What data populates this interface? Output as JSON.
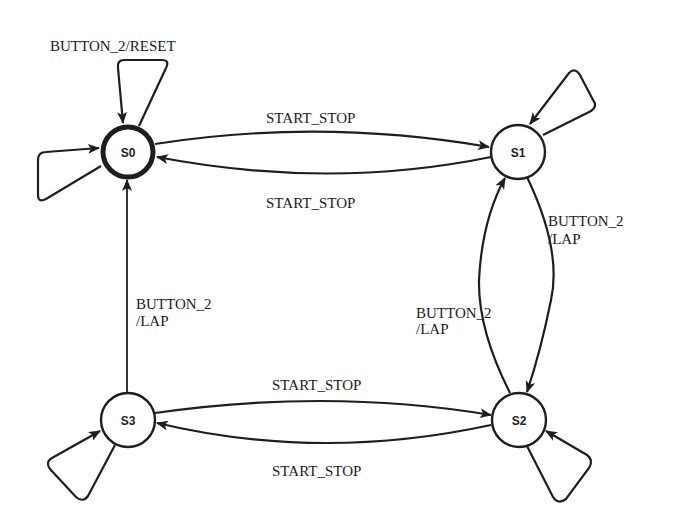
{
  "diagram": {
    "type": "state-machine",
    "initial_state": "S0",
    "states": [
      {
        "id": "S0",
        "label": "S0",
        "initial": true
      },
      {
        "id": "S1",
        "label": "S1",
        "initial": false
      },
      {
        "id": "S2",
        "label": "S2",
        "initial": false
      },
      {
        "id": "S3",
        "label": "S3",
        "initial": false
      }
    ],
    "transitions": [
      {
        "from": "S0",
        "to": "S0",
        "label": "BUTTON_2/RESET"
      },
      {
        "from": "S0",
        "to": "S0",
        "label": ""
      },
      {
        "from": "S0",
        "to": "S1",
        "label": "START_STOP"
      },
      {
        "from": "S1",
        "to": "S0",
        "label": "START_STOP"
      },
      {
        "from": "S1",
        "to": "S1",
        "label": ""
      },
      {
        "from": "S1",
        "to": "S2",
        "label_line1": "BUTTON_2",
        "label_line2": "/LAP"
      },
      {
        "from": "S2",
        "to": "S1",
        "label_line1": "BUTTON_2",
        "label_line2": "/LAP"
      },
      {
        "from": "S2",
        "to": "S2",
        "label": ""
      },
      {
        "from": "S3",
        "to": "S2",
        "label": "START_STOP"
      },
      {
        "from": "S2",
        "to": "S3",
        "label": "START_STOP"
      },
      {
        "from": "S3",
        "to": "S3",
        "label": ""
      },
      {
        "from": "S3",
        "to": "S0",
        "label_line1": "BUTTON_2",
        "label_line2": "/LAP"
      }
    ],
    "labels": {
      "s0_self_reset": "BUTTON_2/RESET",
      "s0_to_s1": "START_STOP",
      "s1_to_s0": "START_STOP",
      "s1_to_s2_line1": "BUTTON_2",
      "s1_to_s2_line2": "/LAP",
      "s2_to_s1_line1": "BUTTON_2",
      "s2_to_s1_line2": "/LAP",
      "s3_to_s2": "START_STOP",
      "s2_to_s3": "START_STOP",
      "s3_to_s0_line1": "BUTTON_2",
      "s3_to_s0_line2": "/LAP"
    },
    "colors": {
      "stroke": "#1e1e1e",
      "background": "#ffffff"
    }
  }
}
